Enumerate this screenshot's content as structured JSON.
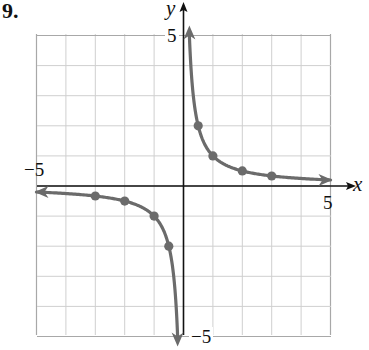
{
  "problem_label": "9.",
  "chart_data": {
    "type": "line",
    "title": "",
    "function": "y = 1/x",
    "xlabel": "x",
    "ylabel": "y",
    "xlim": [
      -5,
      5
    ],
    "ylim": [
      -5,
      5
    ],
    "grid": true,
    "grid_step": 1,
    "tick_labels": {
      "x_min": "−5",
      "x_max": "5",
      "y_max": "5",
      "y_min": "−5"
    },
    "series": [
      {
        "name": "branch-positive",
        "points": [
          [
            0.5,
            2
          ],
          [
            1,
            1
          ],
          [
            2,
            0.5
          ],
          [
            3,
            0.333
          ]
        ],
        "curve_range": [
          0.2,
          5
        ]
      },
      {
        "name": "branch-negative",
        "points": [
          [
            -3,
            -0.333
          ],
          [
            -2,
            -0.5
          ],
          [
            -1,
            -1
          ],
          [
            -0.5,
            -2
          ]
        ],
        "curve_range": [
          -5,
          -0.2
        ]
      }
    ],
    "colors": {
      "curve": "#6b6b6b",
      "grid": "#cfcfcf",
      "axes": "#111111"
    }
  }
}
